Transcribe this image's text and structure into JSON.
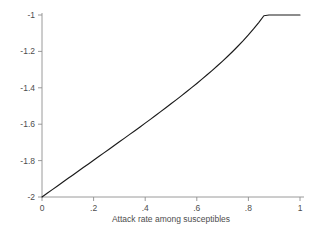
{
  "chart_data": {
    "type": "line",
    "title": "",
    "subtitle": "",
    "xlabel": "Attack rate among susceptibles",
    "ylabel": "",
    "xlim": [
      0,
      1
    ],
    "ylim": [
      -2,
      -1
    ],
    "grid": false,
    "legend": "none",
    "x_ticks": [
      "0",
      ".2",
      ".4",
      ".6",
      ".8",
      "1"
    ],
    "x_tick_values": [
      0,
      0.2,
      0.4,
      0.6,
      0.8,
      1
    ],
    "y_ticks": [
      "-2",
      "-1.8",
      "-1.6",
      "-1.4",
      "-1.2",
      "-1"
    ],
    "y_tick_values": [
      -2,
      -1.8,
      -1.6,
      -1.4,
      -1.2,
      -1
    ],
    "series": [
      {
        "name": "logit curve",
        "color": "#1a1a1a",
        "x": [
          0,
          0.02,
          0.04,
          0.06,
          0.08,
          0.1,
          0.12,
          0.14,
          0.16,
          0.18,
          0.2,
          0.22,
          0.24,
          0.26,
          0.28,
          0.3,
          0.32,
          0.34,
          0.36,
          0.38,
          0.4,
          0.42,
          0.44,
          0.46,
          0.48,
          0.5,
          0.52,
          0.54,
          0.56,
          0.58,
          0.6,
          0.62,
          0.64,
          0.66,
          0.68,
          0.7,
          0.72,
          0.74,
          0.76,
          0.78,
          0.8,
          0.82,
          0.84,
          0.86,
          0.88,
          0.9,
          0.92,
          0.94,
          0.96,
          0.98,
          1
        ],
        "y": [
          -2,
          -1.9797,
          -1.9594,
          -1.9392,
          -1.919,
          -1.8988,
          -1.8786,
          -1.8585,
          -1.8383,
          -1.8182,
          -1.798,
          -1.7778,
          -1.7576,
          -1.7374,
          -1.7171,
          -1.6968,
          -1.6765,
          -1.656,
          -1.6355,
          -1.6149,
          -1.5941,
          -1.5733,
          -1.5523,
          -1.5311,
          -1.5097,
          -1.4881,
          -1.4663,
          -1.4442,
          -1.4218,
          -1.3991,
          -1.376,
          -1.3525,
          -1.3285,
          -1.304,
          -1.2789,
          -1.2531,
          -1.2265,
          -1.199,
          -1.1705,
          -1.1408,
          -1.1096,
          -1.0767,
          -1.0418,
          -1.0042,
          -0.9633,
          -0.9178,
          -0.8658,
          -0.8031,
          -0.7207,
          -0.5914,
          -1.0
        ]
      }
    ],
    "axis_color": "#8f8f8f",
    "text_color": "#4d4d4d",
    "background": "#ffffff"
  },
  "plot": {
    "x_axis_label": "Attack rate among susceptibles"
  }
}
